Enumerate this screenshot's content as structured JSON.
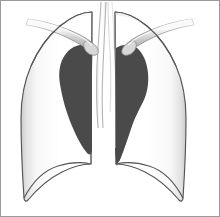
{
  "figure": {
    "kind": "anatomical-illustration",
    "caption": "",
    "width": 220,
    "height": 217,
    "background_color": "#ffffff",
    "frame_border_color": "#9a9a9a"
  },
  "colors": {
    "lung_fill_light": "#ffffff",
    "lung_fill_shade": "#e8e8e8",
    "lung_fill_edge_shade": "#d2d2d2",
    "lung_outline": "#555555",
    "mediastinal_shadow": "#4a4a4a",
    "trachea_fill": "#fbfbfb",
    "trachea_outline": "#bdbdbd",
    "clavicle_fill_light": "#f2f2f2",
    "clavicle_fill_mid": "#cfcfcf",
    "clavicle_fill_dark": "#a8a8a8",
    "clavicle_outline": "#8c8c8c",
    "frame": "#9a9a9a"
  },
  "parts": [
    {
      "id": "right-lung",
      "label": "Right lung field",
      "fill": "#ffffff",
      "outline": "#555555"
    },
    {
      "id": "left-lung",
      "label": "Left lung field",
      "fill": "#ffffff",
      "outline": "#555555"
    },
    {
      "id": "trachea",
      "label": "Trachea / mediastinum",
      "fill": "#fbfbfb",
      "outline": "#bdbdbd"
    },
    {
      "id": "right-mediastinal-shadow",
      "label": "Right mediastinal shadow",
      "fill": "#4a4a4a"
    },
    {
      "id": "left-mediastinal-shadow",
      "label": "Left mediastinal shadow",
      "fill": "#4a4a4a"
    },
    {
      "id": "right-clavicle",
      "label": "Right clavicle",
      "fill": "#cfcfcf",
      "outline": "#8c8c8c"
    },
    {
      "id": "left-clavicle",
      "label": "Left clavicle",
      "fill": "#cfcfcf",
      "outline": "#8c8c8c"
    },
    {
      "id": "right-diaphragm",
      "label": "Right hemidiaphragm border",
      "outline": "#555555"
    },
    {
      "id": "left-diaphragm",
      "label": "Left hemidiaphragm border",
      "outline": "#555555"
    }
  ],
  "annotations": {
    "labels": [],
    "legend": [],
    "title": ""
  }
}
